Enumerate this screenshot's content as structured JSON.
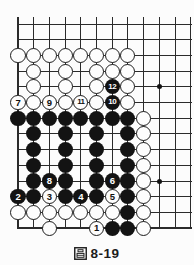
{
  "figure": {
    "caption": {
      "text": "圖 8-19",
      "figure_glyph": "圖",
      "number": "8-19"
    }
  },
  "board": {
    "colors": {
      "line": "#2b2b2b",
      "black_stone": "#131313",
      "white_stone": "#fdfdfd",
      "label_on_black": "#ffffff",
      "label_on_white": "#101010",
      "background": "#fcfcfc"
    },
    "grid": {
      "cols": 12,
      "rows": 14,
      "origin_x": 18,
      "origin_y": 24,
      "cell": 15.7,
      "top_overhang": 7,
      "h_end_x": 191.5,
      "edge_left": true,
      "edge_bottom": true
    },
    "stars": [
      {
        "col": 10,
        "row": 5
      },
      {
        "col": 10,
        "row": 11
      }
    ],
    "stones": [
      {
        "c": 1,
        "r": 3,
        "k": "w"
      },
      {
        "c": 2,
        "r": 3,
        "k": "w"
      },
      {
        "c": 3,
        "r": 3,
        "k": "w"
      },
      {
        "c": 4,
        "r": 3,
        "k": "w"
      },
      {
        "c": 5,
        "r": 3,
        "k": "w"
      },
      {
        "c": 6,
        "r": 3,
        "k": "w"
      },
      {
        "c": 7,
        "r": 3,
        "k": "w"
      },
      {
        "c": 8,
        "r": 3,
        "k": "w"
      },
      {
        "c": 2,
        "r": 4,
        "k": "w"
      },
      {
        "c": 4,
        "r": 4,
        "k": "w"
      },
      {
        "c": 6,
        "r": 4,
        "k": "w"
      },
      {
        "c": 7,
        "r": 4,
        "k": "w"
      },
      {
        "c": 8,
        "r": 4,
        "k": "w"
      },
      {
        "c": 2,
        "r": 5,
        "k": "w"
      },
      {
        "c": 4,
        "r": 5,
        "k": "w"
      },
      {
        "c": 6,
        "r": 5,
        "k": "w"
      },
      {
        "c": 7,
        "r": 5,
        "k": "b",
        "n": "12"
      },
      {
        "c": 8,
        "r": 5,
        "k": "w"
      },
      {
        "c": 1,
        "r": 6,
        "k": "w",
        "n": "7"
      },
      {
        "c": 2,
        "r": 6,
        "k": "w"
      },
      {
        "c": 3,
        "r": 6,
        "k": "w",
        "n": "9"
      },
      {
        "c": 4,
        "r": 6,
        "k": "w"
      },
      {
        "c": 5,
        "r": 6,
        "k": "w",
        "n": "11"
      },
      {
        "c": 6,
        "r": 6,
        "k": "w"
      },
      {
        "c": 7,
        "r": 6,
        "k": "b",
        "n": "10"
      },
      {
        "c": 8,
        "r": 6,
        "k": "w"
      },
      {
        "c": 1,
        "r": 7,
        "k": "b"
      },
      {
        "c": 2,
        "r": 7,
        "k": "b"
      },
      {
        "c": 3,
        "r": 7,
        "k": "b"
      },
      {
        "c": 4,
        "r": 7,
        "k": "b"
      },
      {
        "c": 5,
        "r": 7,
        "k": "b"
      },
      {
        "c": 6,
        "r": 7,
        "k": "b"
      },
      {
        "c": 7,
        "r": 7,
        "k": "b"
      },
      {
        "c": 8,
        "r": 7,
        "k": "b"
      },
      {
        "c": 9,
        "r": 7,
        "k": "w"
      },
      {
        "c": 2,
        "r": 8,
        "k": "b"
      },
      {
        "c": 4,
        "r": 8,
        "k": "b"
      },
      {
        "c": 6,
        "r": 8,
        "k": "b"
      },
      {
        "c": 8,
        "r": 8,
        "k": "b"
      },
      {
        "c": 9,
        "r": 8,
        "k": "w"
      },
      {
        "c": 2,
        "r": 9,
        "k": "b"
      },
      {
        "c": 4,
        "r": 9,
        "k": "b"
      },
      {
        "c": 6,
        "r": 9,
        "k": "b"
      },
      {
        "c": 8,
        "r": 9,
        "k": "b"
      },
      {
        "c": 9,
        "r": 9,
        "k": "w"
      },
      {
        "c": 2,
        "r": 10,
        "k": "b"
      },
      {
        "c": 4,
        "r": 10,
        "k": "b"
      },
      {
        "c": 6,
        "r": 10,
        "k": "b"
      },
      {
        "c": 8,
        "r": 10,
        "k": "b"
      },
      {
        "c": 9,
        "r": 10,
        "k": "w"
      },
      {
        "c": 2,
        "r": 11,
        "k": "b"
      },
      {
        "c": 3,
        "r": 11,
        "k": "b",
        "n": "8"
      },
      {
        "c": 4,
        "r": 11,
        "k": "b"
      },
      {
        "c": 6,
        "r": 11,
        "k": "b"
      },
      {
        "c": 7,
        "r": 11,
        "k": "b",
        "n": "6"
      },
      {
        "c": 8,
        "r": 11,
        "k": "b"
      },
      {
        "c": 9,
        "r": 11,
        "k": "w"
      },
      {
        "c": 1,
        "r": 12,
        "k": "b",
        "n": "2"
      },
      {
        "c": 2,
        "r": 12,
        "k": "b"
      },
      {
        "c": 3,
        "r": 12,
        "k": "w",
        "n": "3"
      },
      {
        "c": 4,
        "r": 12,
        "k": "b"
      },
      {
        "c": 5,
        "r": 12,
        "k": "b",
        "n": "4"
      },
      {
        "c": 6,
        "r": 12,
        "k": "b"
      },
      {
        "c": 7,
        "r": 12,
        "k": "w",
        "n": "5"
      },
      {
        "c": 8,
        "r": 12,
        "k": "b"
      },
      {
        "c": 9,
        "r": 12,
        "k": "w"
      },
      {
        "c": 1,
        "r": 13,
        "k": "w"
      },
      {
        "c": 2,
        "r": 13,
        "k": "w"
      },
      {
        "c": 3,
        "r": 13,
        "k": "w"
      },
      {
        "c": 4,
        "r": 13,
        "k": "w"
      },
      {
        "c": 5,
        "r": 13,
        "k": "w"
      },
      {
        "c": 6,
        "r": 13,
        "k": "w"
      },
      {
        "c": 7,
        "r": 13,
        "k": "w"
      },
      {
        "c": 8,
        "r": 13,
        "k": "b"
      },
      {
        "c": 9,
        "r": 13,
        "k": "w"
      },
      {
        "c": 3,
        "r": 14,
        "k": "w"
      },
      {
        "c": 6,
        "r": 14,
        "k": "w",
        "n": "1"
      },
      {
        "c": 7,
        "r": 14,
        "k": "b"
      },
      {
        "c": 8,
        "r": 14,
        "k": "b"
      },
      {
        "c": 9,
        "r": 14,
        "k": "w"
      }
    ]
  }
}
